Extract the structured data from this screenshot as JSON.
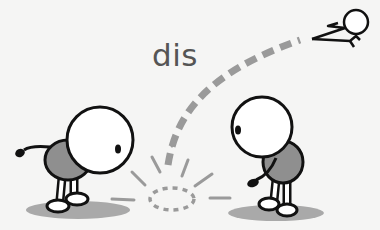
{
  "illustration": {
    "word": "dis",
    "colors": {
      "background": "#f5f5f4",
      "outline": "#111111",
      "body_fill": "#8f8f8f",
      "shadow": "#a9a9a9",
      "trail": "#9a9a9a",
      "text": "#555555"
    },
    "figures": [
      {
        "name": "left-figure",
        "pose": "bent over, facing right"
      },
      {
        "name": "right-figure",
        "pose": "bent over, facing left"
      },
      {
        "name": "flying-figure",
        "pose": "flying away top-right"
      }
    ]
  }
}
